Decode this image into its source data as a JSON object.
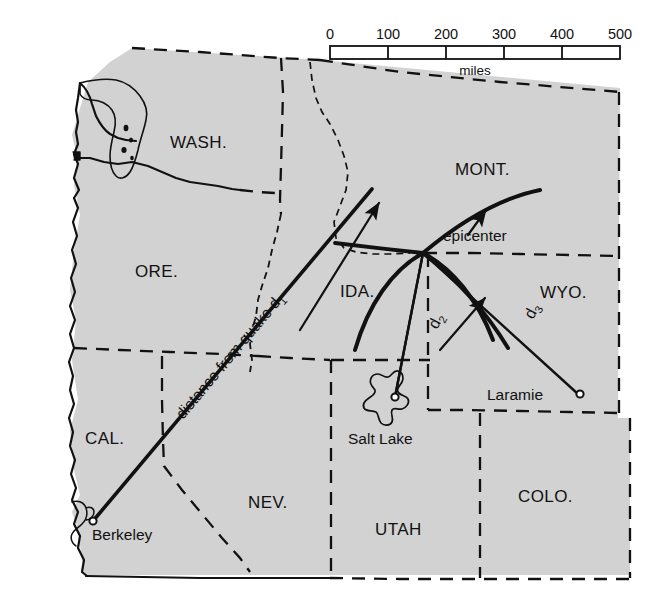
{
  "figure": {
    "kind": "map",
    "background_color": "#ffffff",
    "land_fill_color": "#d2d2d2",
    "ink_color": "#111111"
  },
  "scale_bar": {
    "ticks": [
      "0",
      "100",
      "200",
      "300",
      "400",
      "500"
    ],
    "unit_label": "miles",
    "min": 0,
    "max": 500,
    "step": 100
  },
  "state_labels": [
    {
      "id": "wash",
      "text": "WASH."
    },
    {
      "id": "ore",
      "text": "ORE."
    },
    {
      "id": "mont",
      "text": "MONT."
    },
    {
      "id": "ida",
      "text": "IDA."
    },
    {
      "id": "wyo",
      "text": "WYO."
    },
    {
      "id": "cal",
      "text": "CAL."
    },
    {
      "id": "nev",
      "text": "NEV."
    },
    {
      "id": "utah",
      "text": "UTAH"
    },
    {
      "id": "colo",
      "text": "COLO."
    }
  ],
  "city_labels": [
    {
      "id": "berkeley",
      "text": "Berkeley"
    },
    {
      "id": "salt-lake",
      "text": "Salt Lake"
    },
    {
      "id": "laramie",
      "text": "Laramie"
    }
  ],
  "annotations": {
    "epicenter": "epicenter",
    "distance_one": "distance from quake d",
    "distance_one_sub": "1",
    "distance_two": "d",
    "distance_two_sub": "2",
    "distance_three": "d",
    "distance_three_sub": "3"
  }
}
